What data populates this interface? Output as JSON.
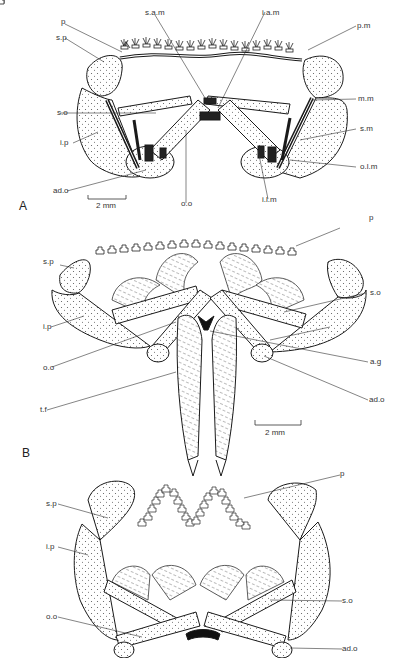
{
  "figure": {
    "panels": [
      {
        "id": "A",
        "letter": "A",
        "scale_bar": "2 mm",
        "labels": {
          "p": "p",
          "sp": "s.p",
          "sam": "s.a.m",
          "iam": "i.a.m",
          "pm": "p.m",
          "so": "s.o",
          "mm": "m.m",
          "ip": "i.p",
          "sm": "s.m",
          "olm": "o.l.m",
          "ado": "ad.o",
          "oo": "o.o",
          "ilm": "i.l.m"
        }
      },
      {
        "id": "B",
        "letter": "B",
        "scale_bar": "2 mm",
        "labels": {
          "p": "p",
          "sp": "s.p",
          "so": "s.o",
          "ip": "i.p",
          "oo": "o.o",
          "ag": "a.g",
          "ado": "ad.o",
          "tf": "t.f"
        }
      },
      {
        "id": "C",
        "letter": "",
        "labels": {
          "p": "p",
          "sp": "s.p",
          "ip": "i.p",
          "so": "s.o",
          "oo": "o.o",
          "ado": "ad.o"
        }
      }
    ],
    "colors": {
      "ink": "#1a1a1a",
      "stipple": "#555555",
      "background": "#ffffff"
    }
  }
}
